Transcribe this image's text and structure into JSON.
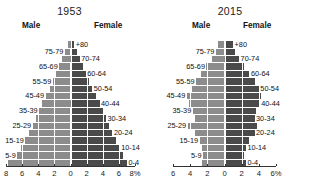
{
  "figure": {
    "kind": "population-pyramid-pair",
    "background_color": "#ffffff",
    "male_color": "#8c8c8c",
    "female_color": "#4a4a4a",
    "gridline_color": "#ffffff",
    "axis_color": "#333333"
  },
  "panels": [
    {
      "id": "panel-1953",
      "title": "1953",
      "male_label": "Male",
      "female_label": "Female",
      "unit": "8%"
    },
    {
      "id": "panel-2015",
      "title": "2015",
      "male_label": "Male",
      "female_label": "Female",
      "unit": "6%"
    }
  ],
  "age_groups": [
    "+80",
    "75-79",
    "70-74",
    "65-69",
    "60-64",
    "55-59",
    "50-54",
    "45-49",
    "40-44",
    "35-39",
    "30-34",
    "25-29",
    "20-24",
    "15-19",
    "10-14",
    "5-9",
    "0-4"
  ],
  "chart_data": [
    {
      "type": "bar",
      "subtype": "population-pyramid",
      "title": "1953",
      "xlabel": "",
      "ylabel": "",
      "unit": "8%",
      "xlim": [
        -8,
        8
      ],
      "xticks": [
        -8,
        -6,
        -4,
        -2,
        0,
        2,
        4,
        6,
        8
      ],
      "xticklabels": [
        "8",
        "6",
        "4",
        "2",
        "0",
        "2",
        "4",
        "6",
        "8%"
      ],
      "grid": true,
      "legend": [
        "Male",
        "Female"
      ],
      "legend_position": "top",
      "categories": [
        "+80",
        "75-79",
        "70-74",
        "65-69",
        "60-64",
        "55-59",
        "50-54",
        "45-49",
        "40-44",
        "35-39",
        "30-34",
        "25-29",
        "20-24",
        "15-19",
        "10-14",
        "5-9",
        "0-4"
      ],
      "series": [
        {
          "name": "Male",
          "side": "left",
          "color": "#8c8c8c",
          "values": [
            0.25,
            0.7,
            1.0,
            1.4,
            1.8,
            2.2,
            2.6,
            3.1,
            3.5,
            3.9,
            4.3,
            4.7,
            5.1,
            5.6,
            6.1,
            6.6,
            7.8
          ]
        },
        {
          "name": "Female",
          "side": "right",
          "color": "#4a4a4a",
          "values": [
            0.45,
            0.8,
            1.15,
            1.5,
            1.9,
            2.3,
            2.7,
            3.2,
            3.6,
            4.0,
            4.4,
            4.8,
            5.2,
            5.7,
            6.1,
            6.5,
            7.0
          ]
        }
      ]
    },
    {
      "type": "bar",
      "subtype": "population-pyramid",
      "title": "2015",
      "xlabel": "",
      "ylabel": "",
      "unit": "6%",
      "xlim": [
        -6,
        6
      ],
      "xticks": [
        -6,
        -4,
        -2,
        0,
        2,
        4,
        6
      ],
      "xticklabels": [
        "6",
        "4",
        "2",
        "0",
        "2",
        "4",
        "6%"
      ],
      "grid": true,
      "legend": [
        "Male",
        "Female"
      ],
      "legend_position": "top",
      "categories": [
        "+80",
        "75-79",
        "70-74",
        "65-69",
        "60-64",
        "55-59",
        "50-54",
        "45-49",
        "40-44",
        "35-39",
        "30-34",
        "25-29",
        "20-24",
        "15-19",
        "10-14",
        "5-9",
        "0-4"
      ],
      "series": [
        {
          "name": "Male",
          "side": "left",
          "color": "#8c8c8c",
          "values": [
            0.7,
            1.0,
            1.5,
            2.1,
            2.7,
            3.3,
            3.8,
            4.4,
            4.1,
            3.7,
            3.4,
            4.3,
            3.4,
            2.9,
            2.6,
            2.5,
            2.6
          ]
        },
        {
          "name": "Female",
          "side": "right",
          "color": "#4a4a4a",
          "values": [
            1.0,
            1.2,
            1.7,
            2.3,
            2.9,
            3.5,
            4.0,
            4.3,
            4.1,
            3.7,
            3.5,
            3.8,
            3.5,
            2.9,
            2.5,
            2.3,
            2.5
          ]
        }
      ]
    }
  ]
}
